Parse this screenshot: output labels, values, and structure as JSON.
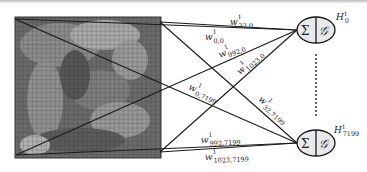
{
  "diagram": {
    "input": {
      "label": "input-image-grid",
      "grid_cells": 32,
      "corners": [
        "top-left",
        "top-right",
        "bottom-left",
        "bottom-right"
      ]
    },
    "nodes": [
      {
        "id": "H0",
        "label": "H",
        "subscript": "0",
        "superscript": "1",
        "sum_symbol": "Σ",
        "activation_symbol": "𝒢"
      },
      {
        "id": "H7199",
        "label": "H",
        "subscript": "7199",
        "superscript": "1",
        "sum_symbol": "Σ",
        "activation_symbol": "𝒢"
      }
    ],
    "ellipsis": "⋮",
    "weights": [
      {
        "base": "w",
        "superscript": "1",
        "subscript": "32,0"
      },
      {
        "base": "w",
        "superscript": "1",
        "subscript": "0,0"
      },
      {
        "base": "w",
        "superscript": "1",
        "subscript": "992,0"
      },
      {
        "base": "w",
        "superscript": "1",
        "subscript": "1023,0"
      },
      {
        "base": "w",
        "superscript": "1",
        "subscript": "0,7199"
      },
      {
        "base": "w",
        "superscript": "1",
        "subscript": "32,7199"
      },
      {
        "base": "w",
        "superscript": "1",
        "subscript": "992,7199"
      },
      {
        "base": "w",
        "superscript": "1",
        "subscript": "1023,7199"
      }
    ],
    "colors": {
      "line": "#1a1a1a",
      "node_fill": "#e9e9e9",
      "grid_line": "#2a2a2a"
    }
  }
}
